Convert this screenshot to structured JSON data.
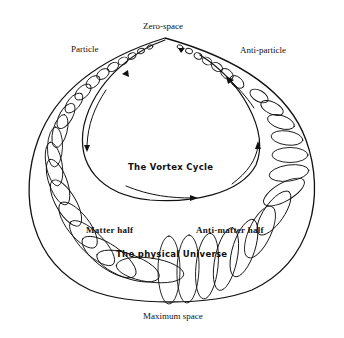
{
  "diagram": {
    "title": "The Vortex Cycle",
    "labels": {
      "top": "Zero-space",
      "left_top": "Particle",
      "right_top": "Anti-particle",
      "center": "The Vortex Cycle",
      "left_bottom": "Matter half",
      "right_bottom": "Anti-matter half",
      "bottom_center": "The physical Universe",
      "bottom": "Maximum space"
    },
    "colors": {
      "ink": "#111111",
      "background": "#ffffff"
    }
  }
}
